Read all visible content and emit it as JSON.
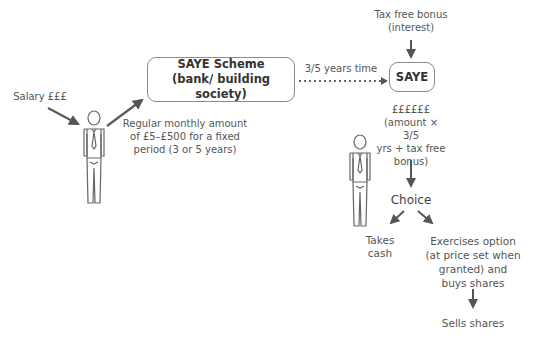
{
  "diagram": {
    "colors": {
      "text": "#555555",
      "box_border": "#8a8a8a",
      "arrow": "#555555"
    },
    "salary_label": "Salary £££",
    "contribution_label": [
      "Regular monthly amount",
      "of £5–£500 for a fixed",
      "period (3 or 5 years)"
    ],
    "scheme_box": {
      "line1": "SAYE Scheme",
      "line2": "(bank/ building society)"
    },
    "time_label": "3/5 years time",
    "bonus_label": [
      "Tax free bonus",
      "(interest)"
    ],
    "saye_box": {
      "label": "SAYE"
    },
    "payout_label": [
      "££££££",
      "(amount × 3/5",
      "yrs + tax free",
      "bonus)"
    ],
    "choice_label": "Choice",
    "option_cash": [
      "Takes",
      "cash"
    ],
    "option_exercise": [
      "Exercises option",
      "(at price set when",
      "granted) and",
      "buys shares"
    ],
    "final_label": "Sells shares",
    "icons": {
      "employee_left": "person-icon",
      "employee_right": "person-icon"
    }
  }
}
